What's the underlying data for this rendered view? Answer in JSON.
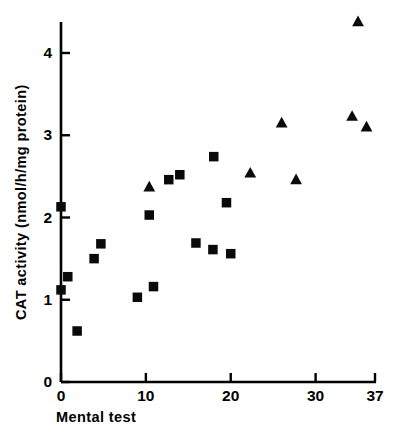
{
  "figure": {
    "background": "#ffffff",
    "ink": "#000000",
    "width": 393,
    "height": 433
  },
  "chart_data": {
    "type": "scatter",
    "title": "",
    "subtitle": "",
    "xlabel": "Mental test",
    "ylabel": "CAT activity  (nmol/h/mg protein)",
    "xlim": [
      0,
      37
    ],
    "ylim": [
      0,
      4.4
    ],
    "grid": false,
    "legend": false,
    "legend_position": "none",
    "xticks": [
      0,
      10,
      20,
      30,
      37
    ],
    "xtick_labels": [
      "0",
      "10",
      "20",
      "30",
      "37"
    ],
    "yticks": [
      0,
      1,
      2,
      3,
      4
    ],
    "ytick_labels": [
      "0",
      "1",
      "2",
      "3",
      "4"
    ],
    "annotations": [],
    "series": [
      {
        "name": "squares",
        "marker": "square",
        "color": "#0a0a0a",
        "points": [
          {
            "x": 0.0,
            "y": 2.13
          },
          {
            "x": 0.8,
            "y": 1.28
          },
          {
            "x": 0.0,
            "y": 1.12
          },
          {
            "x": 1.9,
            "y": 0.62
          },
          {
            "x": 3.9,
            "y": 1.5
          },
          {
            "x": 4.7,
            "y": 1.68
          },
          {
            "x": 9.0,
            "y": 1.03
          },
          {
            "x": 10.4,
            "y": 2.03
          },
          {
            "x": 10.9,
            "y": 1.16
          },
          {
            "x": 12.7,
            "y": 2.46
          },
          {
            "x": 14.0,
            "y": 2.52
          },
          {
            "x": 18.0,
            "y": 2.74
          },
          {
            "x": 15.9,
            "y": 1.69
          },
          {
            "x": 17.9,
            "y": 1.61
          },
          {
            "x": 20.0,
            "y": 1.56
          },
          {
            "x": 19.5,
            "y": 2.18
          }
        ]
      },
      {
        "name": "triangles",
        "marker": "triangle",
        "color": "#0a0a0a",
        "points": [
          {
            "x": 10.4,
            "y": 2.37
          },
          {
            "x": 22.3,
            "y": 2.54
          },
          {
            "x": 26.0,
            "y": 3.15
          },
          {
            "x": 27.7,
            "y": 2.46
          },
          {
            "x": 34.3,
            "y": 3.23
          },
          {
            "x": 35.0,
            "y": 4.38
          },
          {
            "x": 36.0,
            "y": 3.1
          }
        ]
      }
    ]
  }
}
